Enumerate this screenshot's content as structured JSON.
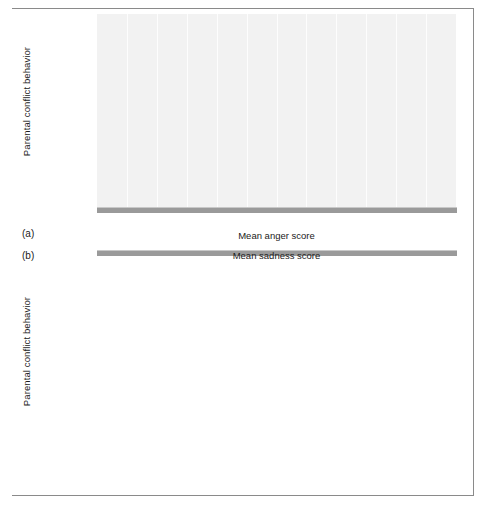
{
  "figure": {
    "y_axis_title": "Parental conflict behavior",
    "categories": [
      "Unresolved\nanger",
      "Observed\nresolution",
      "Explicit\nunobserved\nresolution",
      "Implicit\nunobserved\nresolution"
    ],
    "x_ticks": [
      "0.0",
      "0.1",
      "0.2",
      "0.3",
      "0.4",
      "0.5",
      "0.6",
      "0.7",
      "0.8",
      "0.9",
      "1.0",
      "1.10",
      "1.20"
    ],
    "colors": {
      "light_bar": "#b6b6b6",
      "dark_bar": "#919191",
      "plot_background": "#f2f2f2",
      "gridline": "#ffffff",
      "baseline": "#9a9a9a",
      "frame": "#8a8a8a"
    }
  },
  "panel_a": {
    "letter": "(a)",
    "x_axis_title": "Mean anger score",
    "legend": [
      {
        "label": "5–6 year olds",
        "shade": "light"
      },
      {
        "label": "9–10 year olds",
        "shade": "dark"
      }
    ]
  },
  "panel_b": {
    "letter": "(b)",
    "x_axis_title": "Mean sadness score",
    "legend": [
      {
        "label": "Boys",
        "shade": "dark"
      },
      {
        "label": "Girls",
        "shade": "light"
      }
    ]
  },
  "chart_data": [
    {
      "id": "panel_a",
      "type": "bar",
      "orientation": "horizontal",
      "title": "",
      "xlabel": "Mean anger score",
      "ylabel": "Parental conflict behavior",
      "xlim": [
        0.0,
        1.2
      ],
      "xticks": [
        0.0,
        0.1,
        0.2,
        0.3,
        0.4,
        0.5,
        0.6,
        0.7,
        0.8,
        0.9,
        1.0,
        1.1,
        1.2
      ],
      "xticklabels": [
        "0.0",
        "0.1",
        "0.2",
        "0.3",
        "0.4",
        "0.5",
        "0.6",
        "0.7",
        "0.8",
        "0.9",
        "1.0",
        "1.10",
        "1.20"
      ],
      "grid": "vertical",
      "legend_position": "inside-lower-right",
      "categories": [
        "Unresolved anger",
        "Observed resolution",
        "Explicit unobserved resolution",
        "Implicit unobserved resolution"
      ],
      "series": [
        {
          "name": "5–6 year olds",
          "shade": "light",
          "values": [
            0.82,
            0.54,
            0.29,
            0.4
          ],
          "labels": [
            "0.82",
            "0.54",
            "0.29",
            "0.40"
          ]
        },
        {
          "name": "9–10 year olds",
          "shade": "dark",
          "values": [
            1.2,
            0.16,
            0.07,
            0.17
          ],
          "labels": [
            "1.20",
            "0.16",
            "0.07",
            "0.17"
          ]
        }
      ]
    },
    {
      "id": "panel_b",
      "type": "bar",
      "orientation": "horizontal",
      "title": "",
      "xlabel": "Mean sadness score",
      "ylabel": "Parental conflict behavior",
      "xlim": [
        0.0,
        1.2
      ],
      "xticks": [
        0.0,
        0.1,
        0.2,
        0.3,
        0.4,
        0.5,
        0.6,
        0.7,
        0.8,
        0.9,
        1.0,
        1.1,
        1.2
      ],
      "xticklabels": [
        "0.0",
        "0.1",
        "0.2",
        "0.3",
        "0.4",
        "0.5",
        "0.6",
        "0.7",
        "0.8",
        "0.9",
        "1.0",
        "1.10",
        "1.20"
      ],
      "grid": "vertical",
      "legend_position": "inside-lower-right",
      "categories": [
        "Unresolved anger",
        "Observed resolution",
        "Explicit unobserved resolution",
        "Implicit unobserved resolution"
      ],
      "series": [
        {
          "name": "Boys",
          "shade": "dark",
          "values": [
            0.76,
            0.19,
            0.22,
            0.29
          ],
          "labels": [
            "0.76",
            "0.19",
            "0.22",
            "0.29"
          ]
        },
        {
          "name": "Girls",
          "shade": "light",
          "values": [
            0.22,
            0.17,
            0.47,
            0.26
          ],
          "labels": [
            "0.22",
            "0.17",
            "0.47",
            "0.26"
          ]
        }
      ]
    }
  ]
}
